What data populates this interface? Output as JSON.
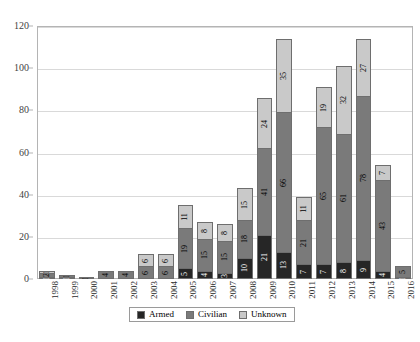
{
  "chart_data": {
    "type": "bar",
    "stacked": true,
    "title": "",
    "subtitle": "",
    "xlabel": "",
    "ylabel": "",
    "ylim": [
      0,
      120
    ],
    "yticks": [
      0,
      20,
      40,
      60,
      80,
      100,
      120
    ],
    "grid": true,
    "legend_position": "bottom",
    "categories": [
      "1998",
      "1999",
      "2000",
      "2001",
      "2002",
      "2003",
      "2004",
      "2005",
      "2006",
      "2007",
      "2008",
      "2009",
      "2010",
      "2011",
      "2012",
      "2013",
      "2014",
      "2015",
      "2016"
    ],
    "series": [
      {
        "name": "Armed",
        "color": "#262626",
        "values": [
          1,
          1,
          0,
          0,
          0,
          0,
          0,
          5,
          4,
          3,
          10,
          21,
          13,
          7,
          7,
          8,
          9,
          4,
          1
        ]
      },
      {
        "name": "Civilian",
        "color": "#7a7a7a",
        "values": [
          2,
          1,
          1,
          4,
          4,
          6,
          6,
          19,
          15,
          15,
          18,
          41,
          66,
          21,
          65,
          61,
          78,
          43,
          5
        ]
      },
      {
        "name": "Unknown",
        "color": "#c9c9c9",
        "values": [
          1,
          0,
          0,
          0,
          0,
          6,
          6,
          11,
          8,
          8,
          15,
          24,
          35,
          11,
          19,
          32,
          27,
          7,
          0
        ]
      }
    ],
    "bar_labels": [
      {
        "year": "1998",
        "armed": "1",
        "civilian": "2",
        "unknown": "1"
      },
      {
        "year": "1999",
        "armed": "1",
        "civilian": "1",
        "unknown": ""
      },
      {
        "year": "2000",
        "armed": "",
        "civilian": "1",
        "unknown": ""
      },
      {
        "year": "2001",
        "armed": "",
        "civilian": "4",
        "unknown": ""
      },
      {
        "year": "2002",
        "armed": "",
        "civilian": "4",
        "unknown": ""
      },
      {
        "year": "2003",
        "armed": "",
        "civilian": "6",
        "unknown": "6"
      },
      {
        "year": "2004",
        "armed": "",
        "civilian": "6",
        "unknown": "6"
      },
      {
        "year": "2005",
        "armed": "5",
        "civilian": "19",
        "unknown": "11"
      },
      {
        "year": "2006",
        "armed": "4",
        "civilian": "15",
        "unknown": "8"
      },
      {
        "year": "2007",
        "armed": "3",
        "civilian": "15",
        "unknown": "8"
      },
      {
        "year": "2008",
        "armed": "10",
        "civilian": "18",
        "unknown": "15"
      },
      {
        "year": "2009",
        "armed": "21",
        "civilian": "41",
        "unknown": "24"
      },
      {
        "year": "2010",
        "armed": "13",
        "civilian": "66",
        "unknown": "35"
      },
      {
        "year": "2011",
        "armed": "7",
        "civilian": "21",
        "unknown": "11"
      },
      {
        "year": "2012",
        "armed": "7",
        "civilian": "65",
        "unknown": "19"
      },
      {
        "year": "2013",
        "armed": "8",
        "civilian": "61",
        "unknown": "32"
      },
      {
        "year": "2014",
        "armed": "9",
        "civilian": "78",
        "unknown": "27"
      },
      {
        "year": "2015",
        "armed": "4",
        "civilian": "43",
        "unknown": "7"
      },
      {
        "year": "2016",
        "armed": "1",
        "civilian": "5",
        "unknown": ""
      }
    ]
  },
  "legend": {
    "items": [
      {
        "label": "Armed",
        "key": "armed"
      },
      {
        "label": "Civilian",
        "key": "civilian"
      },
      {
        "label": "Unknown",
        "key": "unknown"
      }
    ]
  },
  "caption": {
    "text": ""
  }
}
